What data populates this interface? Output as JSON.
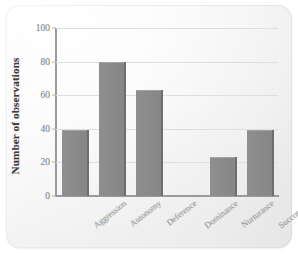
{
  "chart_data": {
    "type": "bar",
    "title": "",
    "xlabel": "",
    "ylabel": "Number of observations",
    "categories": [
      "Aggression",
      "Autonomy",
      "Deference",
      "Dominance",
      "Nurturance",
      "Succorance"
    ],
    "values": [
      39,
      80,
      63,
      0,
      23,
      39
    ],
    "ylim": [
      0,
      100
    ],
    "yticks": [
      0,
      20,
      40,
      60,
      80,
      100
    ],
    "ytick_labels": [
      "0",
      "20",
      "40",
      "60",
      "80",
      "100"
    ],
    "grid": "horizontal",
    "legend": "none",
    "bar_color": "#8a8a8a",
    "axis_color": "#9a9a9a",
    "gridline_color": "#dedede",
    "label_color": "#9a9a9a"
  }
}
